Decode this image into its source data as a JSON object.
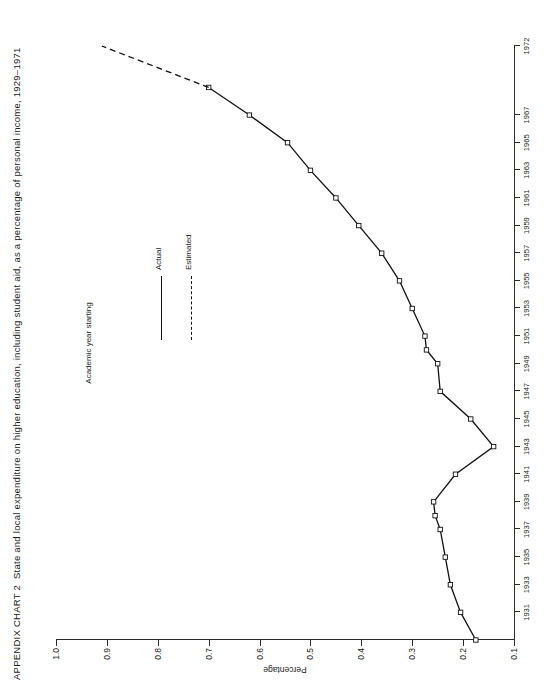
{
  "title": {
    "lead": "APPENDIX CHART 2",
    "text": "State and local expenditure on higher education, including student aid, as a percentage of personal income, 1929–1971"
  },
  "legend": {
    "position": "inside-upper-right",
    "items": [
      {
        "label": "Actual",
        "style": "solid",
        "key_icon": "solid-line-icon"
      },
      {
        "label": "Estimated",
        "style": "dashed",
        "key_icon": "dashed-line-icon"
      }
    ]
  },
  "chart_data": {
    "type": "line",
    "title": "State and local expenditure on higher education, including student aid, as a percentage of personal income, 1929–1971",
    "xlabel": "Academic year starting",
    "ylabel": "Percentage",
    "orientation": "rotated-90",
    "grid": false,
    "xlim": [
      1929,
      1972
    ],
    "ylim": [
      0.1,
      1.0
    ],
    "yticks": [
      "1.0",
      "0.9",
      "0.8",
      "0.7",
      "0.6",
      "0.5",
      "0.4",
      "0.3",
      "0.2",
      "0.1"
    ],
    "ytick_values": [
      1.0,
      0.9,
      0.8,
      0.7,
      0.6,
      0.5,
      0.4,
      0.3,
      0.2,
      0.1
    ],
    "xticks": [
      "1931",
      "1933",
      "1935",
      "1937",
      "1939",
      "1941",
      "1943",
      "1945",
      "1947",
      "1949",
      "1951",
      "1953",
      "1955",
      "1957",
      "1959",
      "1961",
      "1963",
      "1965",
      "1967",
      "1972"
    ],
    "xtick_values": [
      1931,
      1933,
      1935,
      1937,
      1939,
      1941,
      1943,
      1945,
      1947,
      1949,
      1951,
      1953,
      1955,
      1957,
      1959,
      1961,
      1963,
      1965,
      1967,
      1972
    ],
    "series": [
      {
        "name": "Actual",
        "style": "solid",
        "markers": "open-square",
        "x": [
          1929,
          1931,
          1933,
          1935,
          1937,
          1938,
          1939,
          1941,
          1943,
          1945,
          1947,
          1949,
          1950,
          1951,
          1953,
          1955,
          1957,
          1959,
          1961,
          1963,
          1965,
          1967,
          1969
        ],
        "values": [
          0.175,
          0.205,
          0.225,
          0.235,
          0.245,
          0.255,
          0.258,
          0.215,
          0.14,
          0.185,
          0.245,
          0.25,
          0.272,
          0.275,
          0.3,
          0.325,
          0.36,
          0.405,
          0.45,
          0.5,
          0.545,
          0.62,
          0.7
        ]
      },
      {
        "name": "Estimated",
        "style": "dashed",
        "markers": "none",
        "x": [
          1969,
          1972
        ],
        "values": [
          0.7,
          0.91
        ]
      }
    ]
  }
}
